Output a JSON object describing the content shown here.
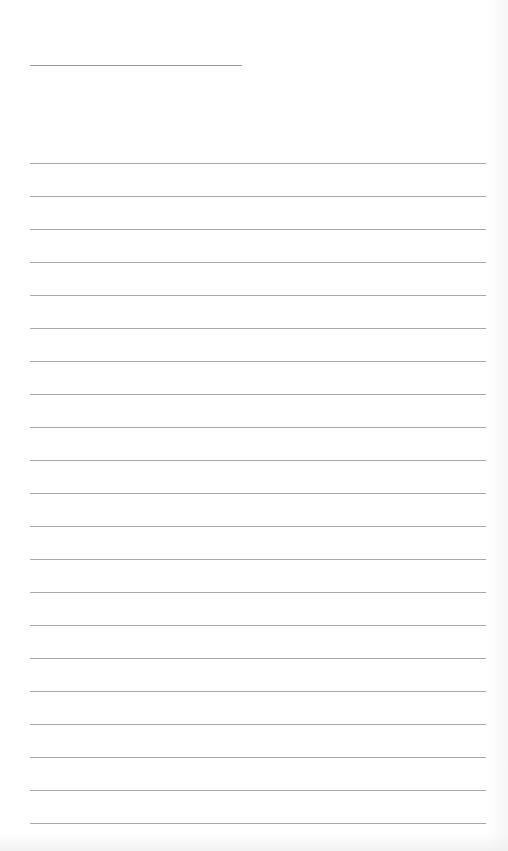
{
  "document": {
    "type": "lined-paper",
    "title_line": {
      "text": "",
      "x": 30,
      "y": 65,
      "width": 212
    },
    "ruled_lines": {
      "count": 21,
      "start_y": 163,
      "spacing": 33,
      "x": 30,
      "width": 456
    },
    "line_texts": [
      "",
      "",
      "",
      "",
      "",
      "",
      "",
      "",
      "",
      "",
      "",
      "",
      "",
      "",
      "",
      "",
      "",
      "",
      "",
      "",
      ""
    ]
  },
  "colors": {
    "paper": "#ffffff",
    "line": "#a8a8a8"
  }
}
